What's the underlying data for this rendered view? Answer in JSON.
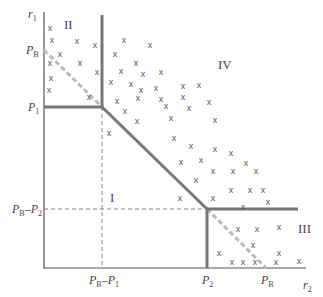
{
  "diagram": {
    "axes": {
      "y_label": "r",
      "y_label_sub": "1",
      "x_label": "r",
      "x_label_sub": "2"
    },
    "y_ticks": [
      {
        "main": "P",
        "sub": "B",
        "suffix": "",
        "suffix_sub": "",
        "y": 50
      },
      {
        "main": "P",
        "sub": "1",
        "suffix": "",
        "suffix_sub": "",
        "y": 107
      },
      {
        "main": "P",
        "sub": "B",
        "suffix": "–P",
        "suffix_sub": "2",
        "y": 209
      }
    ],
    "x_ticks": [
      {
        "main": "P",
        "sub": "B",
        "suffix": "–P",
        "suffix_sub": "1",
        "x": 102
      },
      {
        "main": "P",
        "sub": "2",
        "suffix": "",
        "suffix_sub": "",
        "x": 207
      },
      {
        "main": "P",
        "sub": "B",
        "suffix": "",
        "suffix_sub": "",
        "x": 266
      }
    ],
    "regions": {
      "I": "I",
      "II": "II",
      "III": "III",
      "IV": "IV"
    },
    "marker_glyph": "x",
    "colors": {
      "boundary": "#777777",
      "dashed_diagonal": "#bbbbbb",
      "axis": "#555555",
      "guide": "#666666"
    }
  }
}
